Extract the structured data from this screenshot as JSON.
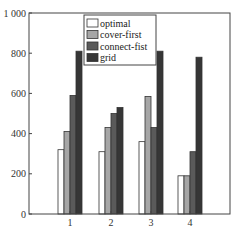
{
  "chart_data": {
    "type": "bar",
    "title": "",
    "xlabel": "",
    "ylabel": "",
    "categories": [
      "1",
      "2",
      "3",
      "4"
    ],
    "series": [
      {
        "name": "optimal",
        "color": "#ffffff",
        "values": [
          320,
          310,
          360,
          190
        ]
      },
      {
        "name": "cover-first",
        "color": "#a6a6a6",
        "values": [
          410,
          430,
          585,
          190
        ]
      },
      {
        "name": "connect-fist",
        "color": "#5a5a5a",
        "values": [
          590,
          500,
          430,
          310
        ]
      },
      {
        "name": "grid",
        "color": "#363636",
        "values": [
          810,
          530,
          810,
          780
        ]
      }
    ],
    "ylim": [
      0,
      1000
    ],
    "yticks": [
      0,
      200,
      400,
      600,
      800,
      1000
    ],
    "ytick_labels": [
      "0",
      "200",
      "400",
      "600",
      "800",
      "1 000"
    ],
    "grid": false,
    "legend_position": "upper-left-inside"
  }
}
